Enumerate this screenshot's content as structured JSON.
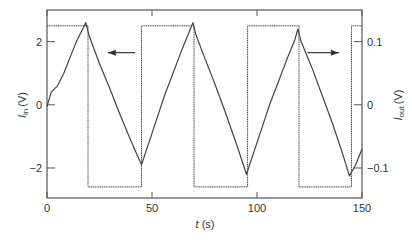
{
  "chart_data": {
    "type": "line",
    "title": "",
    "xlabel": "t (s)",
    "xlabel_var": "t",
    "xlabel_unit": "(s)",
    "ylabel_left": "I_in (V)",
    "ylabel_left_var": "I",
    "ylabel_left_sub": "in",
    "ylabel_left_unit": "(V)",
    "ylabel_right": "I_out (V)",
    "ylabel_right_var": "I",
    "ylabel_right_sub": "out",
    "ylabel_right_unit": "(V)",
    "xlim": [
      0,
      150
    ],
    "ylim_left": [
      -2.95,
      3.0
    ],
    "ylim_right": [
      -0.1475,
      0.15
    ],
    "grid": false,
    "x_ticks": [
      {
        "value": 0,
        "label": "0"
      },
      {
        "value": 50,
        "label": "50"
      },
      {
        "value": 100,
        "label": "100"
      },
      {
        "value": 150,
        "label": "150"
      }
    ],
    "y_left_ticks": [
      {
        "value": 2,
        "label": "2"
      },
      {
        "value": 0,
        "label": "0"
      },
      {
        "value": -2,
        "label": "−2"
      }
    ],
    "y_right_ticks": [
      {
        "value": 0.1,
        "label": "0.1"
      },
      {
        "value": 0,
        "label": "0"
      },
      {
        "value": -0.1,
        "label": "−0.1"
      }
    ],
    "series": [
      {
        "name": "I_in (triangle wave)",
        "axis": "left",
        "style": "solid",
        "x": [
          0,
          2,
          5,
          8,
          11,
          14,
          17,
          18.5,
          20,
          25,
          30,
          35,
          40,
          45,
          48,
          52,
          56,
          60,
          64,
          68,
          69.5,
          71,
          75,
          80,
          85,
          90,
          95,
          98,
          102,
          106,
          110,
          114,
          118,
          119.5,
          121,
          126,
          131,
          136,
          141,
          144,
          147,
          150
        ],
        "values": [
          -0.05,
          0.4,
          0.6,
          1.0,
          1.5,
          2.0,
          2.4,
          2.6,
          2.2,
          1.3,
          0.5,
          -0.35,
          -1.15,
          -1.9,
          -1.3,
          -0.5,
          0.3,
          1.0,
          1.7,
          2.35,
          2.6,
          2.2,
          1.5,
          0.65,
          -0.25,
          -1.2,
          -2.2,
          -1.6,
          -0.8,
          0.0,
          0.7,
          1.4,
          2.05,
          2.4,
          2.0,
          1.2,
          0.3,
          -0.6,
          -1.6,
          -2.25,
          -1.9,
          -1.4
        ]
      },
      {
        "name": "I_out (square wave)",
        "axis": "right",
        "style": "dotted",
        "x": [
          0,
          19.5,
          19.5,
          45,
          45,
          70,
          70,
          95.5,
          95.5,
          120,
          120,
          145,
          145,
          150
        ],
        "values": [
          0.125,
          0.125,
          -0.13,
          -0.13,
          0.125,
          0.125,
          -0.13,
          -0.13,
          0.125,
          0.125,
          -0.13,
          -0.13,
          0.125,
          0.125
        ]
      }
    ],
    "annotations": [
      {
        "type": "arrow",
        "direction": "left",
        "meaning": "triangle trace uses left axis",
        "x_from": 42,
        "x_to": 29,
        "y_left": 1.65
      },
      {
        "type": "arrow",
        "direction": "right",
        "meaning": "square trace uses right axis",
        "x_from": 124,
        "x_to": 139,
        "y_left": 1.65
      }
    ],
    "legend": "none"
  }
}
